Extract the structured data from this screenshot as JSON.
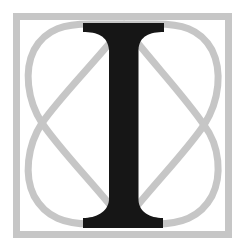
{
  "logo": {
    "letter": "I",
    "colors": {
      "background": "#ffffff",
      "frame": "#c6c6c6",
      "curves": "#c6c6c6",
      "letter": "#161616"
    }
  }
}
